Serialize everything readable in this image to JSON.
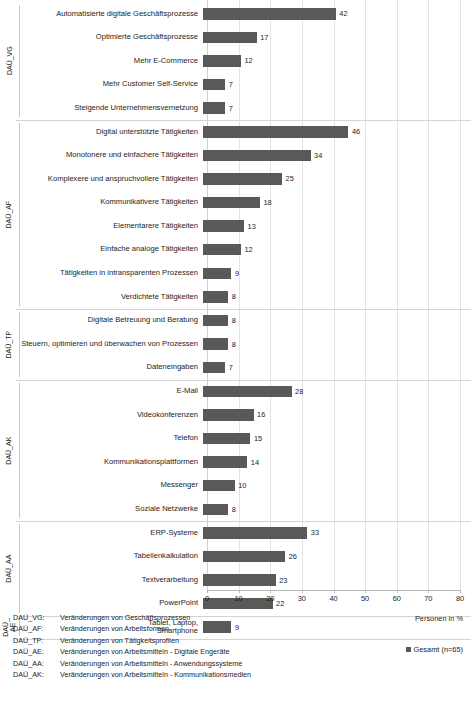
{
  "chart_data": {
    "type": "bar",
    "orientation": "horizontal",
    "title": "",
    "subtitle": "",
    "xlabel": "Personen in %",
    "ylabel": "",
    "xlim": [
      0,
      80
    ],
    "xticks": [
      0,
      10,
      20,
      30,
      40,
      50,
      60,
      70,
      80
    ],
    "grid": true,
    "grid_axis": "x",
    "legend_position": "bottom-right",
    "bar_color": "#595959",
    "series": [
      {
        "name": "Gesamt (n=65)",
        "values": [
          42,
          17,
          12,
          7,
          7,
          46,
          34,
          25,
          18,
          13,
          12,
          9,
          8,
          8,
          8,
          7,
          28,
          16,
          15,
          14,
          10,
          8,
          33,
          26,
          23,
          22,
          9
        ]
      }
    ],
    "categories": [
      "Automatisierte digitale Geschäftsprozesse",
      "Optimierte Geschäftsprozesse",
      "Mehr E-Commerce",
      "Mehr Customer Self-Service",
      "Steigende Unternehmensvernetzung",
      "Digital unterstützte Tätigkeiten",
      "Monotonere und einfachere Tätigkeiten",
      "Komplexere und anspruchvollere Tätigkeiten",
      "Kommunikativere Tätigkeiten",
      "Elementarere Tätigkeiten",
      "Einfache analoge Tätigkeiten",
      "Tätigkeiten in intransparenten Prozessen",
      "Verdichtete Tätigkeiten",
      "Digitale Betreuung und Beratung",
      "Steuern, optimieren und überwachen von Prozessen",
      "Dateneingaben",
      "E-Mail",
      "Videokonferenzen",
      "Telefon",
      "Kommunikationsplattformen",
      "Messenger",
      "Soziale Netzwerke",
      "ERP-Systeme",
      "Tabellenkalkulation",
      "Textverarbeitung",
      "PowerPoint",
      "Tablet, Laptop,\nSmartphone"
    ],
    "groups": [
      {
        "code": "DAÜ_VG",
        "items": [
          {
            "label": "Automatisierte digitale Geschäftsprozesse",
            "value": 42
          },
          {
            "label": "Optimierte Geschäftsprozesse",
            "value": 17
          },
          {
            "label": "Mehr E-Commerce",
            "value": 12
          },
          {
            "label": "Mehr Customer Self-Service",
            "value": 7
          },
          {
            "label": "Steigende Unternehmensvernetzung",
            "value": 7
          }
        ]
      },
      {
        "code": "DAÜ_AF",
        "items": [
          {
            "label": "Digital unterstützte Tätigkeiten",
            "value": 46
          },
          {
            "label": "Monotonere und einfachere Tätigkeiten",
            "value": 34
          },
          {
            "label": "Komplexere und anspruchvollere Tätigkeiten",
            "value": 25
          },
          {
            "label": "Kommunikativere Tätigkeiten",
            "value": 18
          },
          {
            "label": "Elementarere Tätigkeiten",
            "value": 13
          },
          {
            "label": "Einfache analoge Tätigkeiten",
            "value": 12
          },
          {
            "label": "Tätigkeiten in intransparenten Prozessen",
            "value": 9
          },
          {
            "label": "Verdichtete Tätigkeiten",
            "value": 8
          }
        ]
      },
      {
        "code": "DAÜ_TP",
        "items": [
          {
            "label": "Digitale Betreuung und Beratung",
            "value": 8
          },
          {
            "label": "Steuern, optimieren und überwachen von Prozessen",
            "value": 8
          },
          {
            "label": "Dateneingaben",
            "value": 7
          }
        ]
      },
      {
        "code": "DAÜ_AK",
        "items": [
          {
            "label": "E-Mail",
            "value": 28
          },
          {
            "label": "Videokonferenzen",
            "value": 16
          },
          {
            "label": "Telefon",
            "value": 15
          },
          {
            "label": "Kommunikationsplattformen",
            "value": 14
          },
          {
            "label": "Messenger",
            "value": 10
          },
          {
            "label": "Soziale Netzwerke",
            "value": 8
          }
        ]
      },
      {
        "code": "DAÜ_AA",
        "items": [
          {
            "label": "ERP-Systeme",
            "value": 33
          },
          {
            "label": "Tabellenkalkulation",
            "value": 26
          },
          {
            "label": "Textverarbeitung",
            "value": 23
          },
          {
            "label": "PowerPoint",
            "value": 22
          }
        ]
      },
      {
        "code": "DAÜ_\nAE",
        "items": [
          {
            "label": "Tablet, Laptop,\nSmartphone",
            "value": 9
          }
        ]
      }
    ]
  },
  "legend": {
    "series_label": "Gesamt (n=65)",
    "swatch_color": "#595959"
  },
  "axis": {
    "x_title": "Personen in %"
  },
  "abbreviations": [
    {
      "code": "DAÜ_VG:",
      "description": "Veränderungen von Geschäftsprozessen"
    },
    {
      "code": "DAÜ_AF:",
      "description": "Veränderungen von Arbeitsformen"
    },
    {
      "code": "DAÜ_TP:",
      "description": "Veränderungen von Tätigkeitsprofilen"
    },
    {
      "code": "DAÜ_AE:",
      "description": "Veränderungen von Arbeitsmitteln - Digitale Engeräte"
    },
    {
      "code": "DAÜ_AA:",
      "description": "Veränderungen von Arbeitsmitteln - Anwendungssysteme"
    },
    {
      "code": "DAÜ_AK:",
      "description": "Veränderungen von Arbeitsmitteln - Kommunikationsmedien"
    }
  ]
}
